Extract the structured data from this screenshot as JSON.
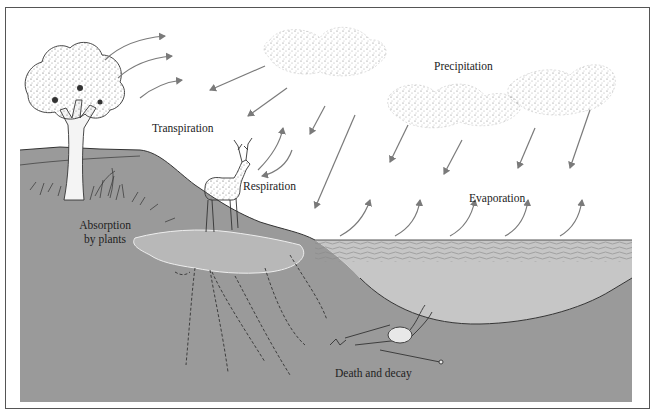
{
  "diagram": {
    "type": "water-cycle",
    "labels": {
      "transpiration": "Transpiration",
      "precipitation": "Precipitation",
      "respiration": "Respiration",
      "evaporation": "Evaporation",
      "absorption_line1": "Absorption",
      "absorption_line2": "by plants",
      "death_decay": "Death and decay"
    },
    "colors": {
      "soil": "#9a9a9a",
      "groundwater_pool": "#b8b8b8",
      "lake": "#c6c6c6",
      "lake_surface": "#8a8a8a",
      "arrow": "#7a7a7a",
      "outline": "#333333",
      "frame": "#555555"
    },
    "elements": [
      "tree",
      "deer",
      "clouds",
      "lake",
      "skeleton",
      "soil",
      "groundwater",
      "roots",
      "arrows"
    ]
  }
}
